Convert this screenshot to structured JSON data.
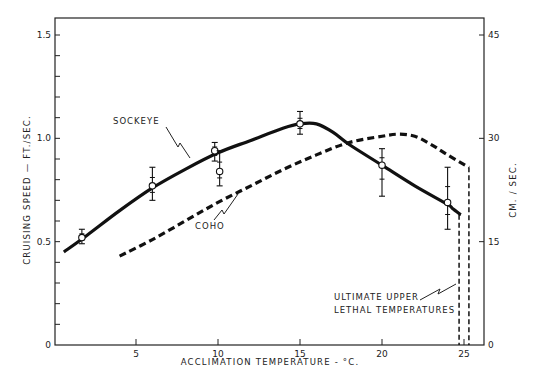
{
  "chart_data": {
    "type": "line",
    "title": "",
    "xlabel": "ACCLIMATION TEMPERATURE - °C.",
    "ylabel": "CRUISING SPEED — FT./SEC.",
    "ylabel_right": "CM. / SEC.",
    "xlim": [
      0,
      26
    ],
    "ylim": [
      0,
      1.5
    ],
    "ylim_right": [
      0,
      45
    ],
    "x_ticks": [
      5,
      10,
      15,
      20,
      25
    ],
    "y_ticks": [
      0,
      0.5,
      1.0,
      1.5
    ],
    "y_tick_labels": [
      "0",
      "0.5",
      "1.0",
      "1.5"
    ],
    "y_right_ticks": [
      0,
      15,
      30,
      45
    ],
    "grid": false,
    "series": [
      {
        "name": "SOCKEYE",
        "style": "solid",
        "curve": [
          [
            0.6,
            0.45
          ],
          [
            2,
            0.53
          ],
          [
            4,
            0.65
          ],
          [
            6,
            0.76
          ],
          [
            8,
            0.85
          ],
          [
            10,
            0.93
          ],
          [
            12,
            0.99
          ],
          [
            14,
            1.05
          ],
          [
            15,
            1.07
          ],
          [
            16,
            1.07
          ],
          [
            17,
            1.03
          ],
          [
            18,
            0.97
          ],
          [
            20,
            0.87
          ],
          [
            22,
            0.77
          ],
          [
            24,
            0.68
          ],
          [
            24.3,
            0.66
          ],
          [
            24.8,
            0.63
          ]
        ],
        "points": [
          {
            "x": 1.7,
            "y": 0.52,
            "err_low": 0.49,
            "err_high": 0.56
          },
          {
            "x": 6.0,
            "y": 0.77,
            "err_low": 0.7,
            "err_high": 0.86
          },
          {
            "x": 9.8,
            "y": 0.94,
            "err_low": 0.89,
            "err_high": 0.98
          },
          {
            "x": 10.1,
            "y": 0.84,
            "err_low": 0.77,
            "err_high": 0.94
          },
          {
            "x": 15.0,
            "y": 1.07,
            "err_low": 1.02,
            "err_high": 1.13
          },
          {
            "x": 20.0,
            "y": 0.87,
            "err_low": 0.72,
            "err_high": 0.95
          },
          {
            "x": 24.0,
            "y": 0.69,
            "err_low": 0.56,
            "err_high": 0.86
          }
        ],
        "lethal_temperature": 24.7
      },
      {
        "name": "COHO",
        "style": "dashed",
        "curve": [
          [
            4,
            0.43
          ],
          [
            6,
            0.51
          ],
          [
            8,
            0.6
          ],
          [
            10,
            0.69
          ],
          [
            12,
            0.77
          ],
          [
            14,
            0.85
          ],
          [
            16,
            0.92
          ],
          [
            18,
            0.98
          ],
          [
            20,
            1.01
          ],
          [
            21,
            1.02
          ],
          [
            22,
            1.01
          ],
          [
            23,
            0.97
          ],
          [
            24,
            0.92
          ],
          [
            25.3,
            0.86
          ]
        ],
        "lethal_temperature": 25.3
      }
    ],
    "annotations": [
      {
        "text": "SOCKEYE",
        "target": "SOCKEYE curve"
      },
      {
        "text": "COHO",
        "target": "COHO curve"
      },
      {
        "text": "ULTIMATE UPPER",
        "line": 1
      },
      {
        "text": "LETHAL TEMPERATURES",
        "line": 2
      }
    ]
  },
  "labels": {
    "xlabel": "ACCLIMATION   TEMPERATURE - °C.",
    "ylabel": "CRUISING SPEED — FT./SEC.",
    "ylabel_right": "CM. / SEC.",
    "sockeye": "SOCKEYE",
    "coho": "COHO",
    "lethal_line1": "ULTIMATE UPPER",
    "lethal_line2": "LETHAL TEMPERATURES"
  }
}
